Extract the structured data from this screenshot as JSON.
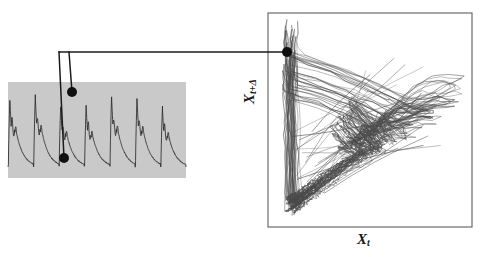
{
  "figure": {
    "type": "delay-embedding-diagram",
    "background_color": "#ffffff",
    "ink_color": "#1a1a1a"
  },
  "timeseries_panel": {
    "name": "time-series-strip",
    "background_color": "#c9c9c9",
    "trace_color": "#2b2b2b",
    "x": 8,
    "y": 82,
    "width": 178,
    "height": 96,
    "cycles": 7,
    "signal_label": "",
    "samples": [
      0.18,
      0.16,
      0.15,
      0.15,
      0.16,
      0.62,
      0.95,
      0.58,
      0.4,
      0.46,
      0.42,
      0.34,
      0.3,
      0.27,
      0.25,
      0.23,
      0.21,
      0.19,
      0.17,
      0.16,
      0.15,
      0.15,
      0.17,
      0.6,
      0.93,
      0.56,
      0.42,
      0.5,
      0.44,
      0.36,
      0.31,
      0.28,
      0.25,
      0.23,
      0.21,
      0.19,
      0.17,
      0.16,
      0.15,
      0.16,
      0.18,
      0.64,
      0.97,
      0.6,
      0.43,
      0.49,
      0.45,
      0.37,
      0.32,
      0.29,
      0.26,
      0.24,
      0.22,
      0.2,
      0.18,
      0.16,
      0.15,
      0.15,
      0.17,
      0.61,
      0.94,
      0.57,
      0.41,
      0.47,
      0.43,
      0.35,
      0.3,
      0.27,
      0.25,
      0.23,
      0.21,
      0.19
    ]
  },
  "attractor_panel": {
    "name": "phase-space-plot",
    "frame_color": "#6b6b6b",
    "trace_color": "#4a4a4a",
    "x": 268,
    "y": 13,
    "width": 204,
    "height": 214,
    "xlabel_main": "X",
    "xlabel_sub": "t",
    "ylabel_main": "X",
    "ylabel_sub": "t+Δ",
    "trajectory_count": 32
  },
  "annotations": {
    "marker_color": "#101010",
    "leader_color": "#1a1a1a",
    "marker_radius": 5,
    "points": [
      {
        "name": "timeseries-upper-marker",
        "x": 72,
        "y": 92,
        "role": "x_t_plus_delta_sample"
      },
      {
        "name": "timeseries-lower-marker",
        "x": 64,
        "y": 158,
        "role": "x_t_sample"
      },
      {
        "name": "attractor-marker",
        "x": 287,
        "y": 52,
        "role": "embedded_point"
      }
    ],
    "leaders": [
      {
        "name": "leader-horizontal",
        "from_x": 59,
        "from_y": 52,
        "to_x": 287,
        "to_y": 52
      },
      {
        "name": "leader-vertical-long",
        "from_x": 59,
        "from_y": 52,
        "to_x": 64,
        "to_y": 158
      },
      {
        "name": "leader-vertical-short",
        "from_x": 69,
        "from_y": 52,
        "to_x": 72,
        "to_y": 92
      }
    ]
  }
}
